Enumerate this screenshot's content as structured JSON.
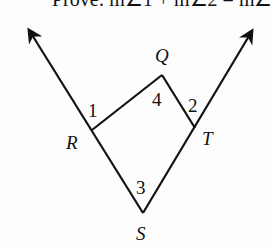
{
  "prompt": {
    "text": "Prove: m∠1 + m∠2 = m∠3"
  },
  "diagram": {
    "points": {
      "R": {
        "label": "R",
        "x": 92,
        "y": 130
      },
      "Q": {
        "label": "Q",
        "x": 162,
        "y": 75
      },
      "T": {
        "label": "T",
        "x": 195,
        "y": 128
      },
      "S": {
        "label": "S",
        "x": 143,
        "y": 213
      }
    },
    "angles": [
      {
        "id": "1",
        "label": "1"
      },
      {
        "id": "2",
        "label": "2"
      },
      {
        "id": "3",
        "label": "3"
      },
      {
        "id": "4",
        "label": "4"
      }
    ],
    "rays": [
      {
        "name": "ray-SR",
        "from": "S",
        "through": "R"
      },
      {
        "name": "ray-ST",
        "from": "S",
        "through": "T"
      }
    ],
    "segments": [
      "RQ",
      "QT"
    ],
    "colors": {
      "line": "#111111",
      "background": "#fdfdfd"
    }
  }
}
